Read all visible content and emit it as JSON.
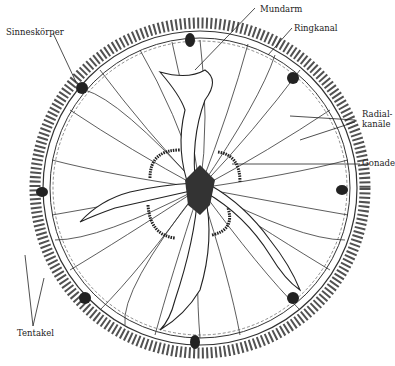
{
  "diagram": {
    "style": "black-and-white line engraving",
    "colors": {
      "ink": "#222222",
      "paper": "#ffffff",
      "dark_fill": "#333333"
    },
    "labels": {
      "sinneskoerper": "Sinneskörper",
      "mundarm": "Mundarm",
      "ringkanal": "Ringkanal",
      "radialkanaele_line1": "Radial-",
      "radialkanaele_line2": "kanäle",
      "gonade": "Gonade",
      "tentakel": "Tentakel"
    },
    "structures": {
      "oral_arms": 4,
      "gonads": 4,
      "sense_organs": 8
    }
  }
}
